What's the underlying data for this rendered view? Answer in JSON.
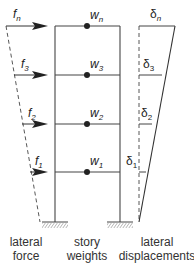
{
  "diagram": {
    "forces": [
      {
        "id": "fn",
        "label": "f",
        "sub": "n"
      },
      {
        "id": "f3",
        "label": "f",
        "sub": "3"
      },
      {
        "id": "f2",
        "label": "f",
        "sub": "2"
      },
      {
        "id": "f1",
        "label": "f",
        "sub": "1"
      }
    ],
    "weights": [
      {
        "id": "wn",
        "label": "w",
        "sub": "n"
      },
      {
        "id": "w3",
        "label": "w",
        "sub": "3"
      },
      {
        "id": "w2",
        "label": "w",
        "sub": "2"
      },
      {
        "id": "w1",
        "label": "w",
        "sub": "1"
      }
    ],
    "displacements": [
      {
        "id": "dn",
        "label": "δ",
        "sub": "n"
      },
      {
        "id": "d3",
        "label": "δ",
        "sub": "3"
      },
      {
        "id": "d2",
        "label": "δ",
        "sub": "2"
      },
      {
        "id": "d1",
        "label": "δ",
        "sub": "1"
      }
    ],
    "captions": {
      "force_line1": "lateral",
      "force_line2": "force",
      "weights_line1": "story",
      "weights_line2": "weights",
      "disp_line1": "lateral",
      "disp_line2": "displacements"
    }
  }
}
